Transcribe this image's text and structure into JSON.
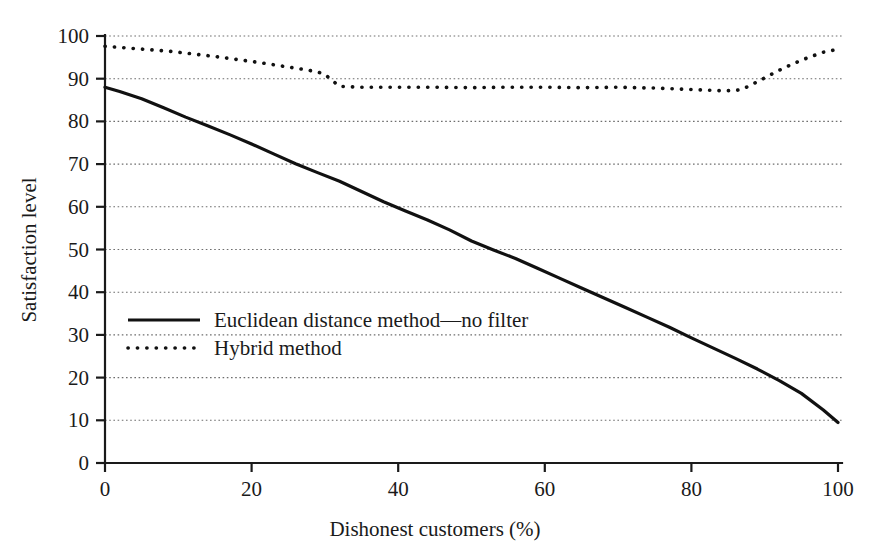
{
  "chart_data": {
    "type": "line",
    "title": "",
    "subtitle": "",
    "xlabel": "Dishonest customers (%)",
    "ylabel": "Satisfaction level",
    "xlim": [
      0,
      100
    ],
    "ylim": [
      0,
      100
    ],
    "xticks": [
      0,
      20,
      40,
      60,
      80,
      100
    ],
    "xtick_labels": [
      "0",
      "20",
      "40",
      "60",
      "80",
      "100"
    ],
    "yticks": [
      0,
      10,
      20,
      30,
      40,
      50,
      60,
      70,
      80,
      90,
      100
    ],
    "ytick_labels": [
      "0",
      "10",
      "20",
      "30",
      "40",
      "50",
      "60",
      "70",
      "80",
      "90",
      "100"
    ],
    "grid": "horizontal-dotted",
    "legend_position": "center-left-inside",
    "series": [
      {
        "name": "Euclidean distance method—no filter",
        "style": "solid",
        "color": "#111111",
        "x": [
          0,
          2,
          5,
          8,
          11,
          14,
          17,
          20,
          23,
          26,
          29,
          32,
          35,
          38,
          41,
          44,
          47,
          50,
          53,
          56,
          59,
          62,
          65,
          68,
          71,
          74,
          77,
          80,
          83,
          86,
          89,
          92,
          95,
          98,
          100
        ],
        "y": [
          88.0,
          87.0,
          85.3,
          83.2,
          81.0,
          79.0,
          76.9,
          74.7,
          72.4,
          70.1,
          68.0,
          66.0,
          63.6,
          61.2,
          59.0,
          56.9,
          54.6,
          52.0,
          49.9,
          47.9,
          45.6,
          43.3,
          41.0,
          38.7,
          36.4,
          34.1,
          31.8,
          29.3,
          26.9,
          24.5,
          22.0,
          19.3,
          16.3,
          12.4,
          9.5
        ]
      },
      {
        "name": "Hybrid method",
        "style": "dotted",
        "color": "#111111",
        "x": [
          0,
          3,
          6,
          9,
          12,
          15,
          18,
          21,
          24,
          27,
          29,
          30,
          31,
          32,
          35,
          40,
          45,
          50,
          55,
          60,
          65,
          70,
          75,
          78,
          81,
          84,
          86,
          87,
          88,
          90,
          92,
          94,
          96,
          98,
          100
        ],
        "y": [
          97.6,
          97.2,
          96.8,
          96.4,
          95.8,
          95.2,
          94.5,
          93.8,
          93.0,
          92.2,
          91.6,
          91.0,
          89.6,
          88.2,
          88.0,
          88.0,
          88.0,
          87.9,
          88.0,
          88.0,
          87.9,
          88.0,
          87.8,
          87.6,
          87.4,
          87.2,
          87.2,
          87.6,
          88.4,
          90.2,
          92.0,
          93.6,
          95.0,
          96.2,
          96.9
        ]
      }
    ],
    "legend": [
      {
        "label": "Euclidean distance method—no filter",
        "style": "solid"
      },
      {
        "label": "Hybrid method",
        "style": "dotted"
      }
    ]
  },
  "axes": {
    "x_axis_title": "Dishonest customers (%)",
    "y_axis_title": "Satisfaction level"
  }
}
